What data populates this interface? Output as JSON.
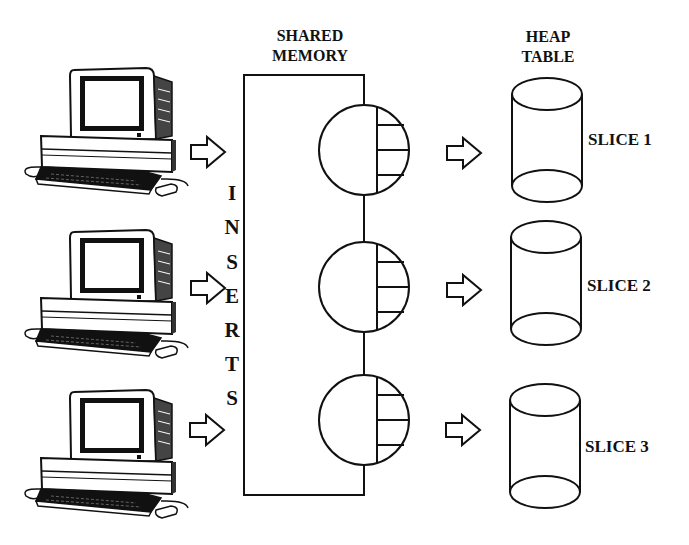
{
  "headers": {
    "shared_memory_line1": "SHARED",
    "shared_memory_line2": "MEMORY",
    "heap_table_line1": "HEAP",
    "heap_table_line2": "TABLE"
  },
  "inserts_label": [
    "I",
    "N",
    "S",
    "E",
    "R",
    "T",
    "S"
  ],
  "slices": [
    {
      "label": "SLICE 1"
    },
    {
      "label": "SLICE 2"
    },
    {
      "label": "SLICE 3"
    }
  ],
  "clients": [
    {
      "icon": "desktop-computer-icon"
    },
    {
      "icon": "desktop-computer-icon"
    },
    {
      "icon": "desktop-computer-icon"
    }
  ],
  "colors": {
    "stroke": "#111111",
    "background": "#ffffff"
  }
}
